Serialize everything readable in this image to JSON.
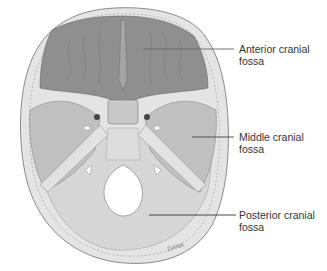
{
  "figure": {
    "signature": "DANA",
    "labels": [
      {
        "id": "anterior",
        "line1": "Anterior cranial",
        "line2": "fossa"
      },
      {
        "id": "middle",
        "line1": "Middle cranial",
        "line2": "fossa"
      },
      {
        "id": "posterior",
        "line1": "Posterior cranial",
        "line2": "fossa"
      }
    ]
  },
  "colors": {
    "background": "#ffffff",
    "bone_outer": "#c9c9c9",
    "anterior_fossa": "#8e8e8e",
    "middle_fossa": "#b8b8b8",
    "posterior_fossa": "#d4d4d4",
    "leader_line": "#555555",
    "label_text": "#333333"
  }
}
